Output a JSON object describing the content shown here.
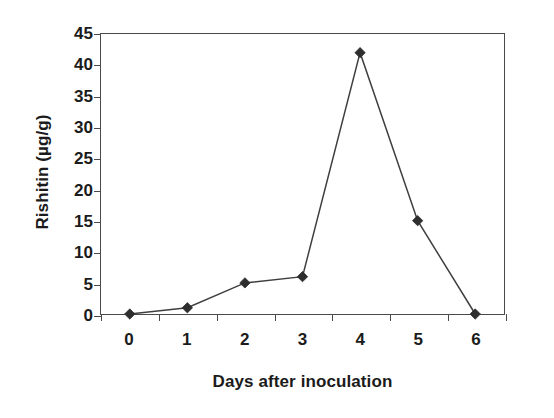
{
  "chart_data": {
    "type": "line",
    "title": "",
    "xlabel": "Days after inoculation",
    "ylabel": "Rishitin (µg/g)",
    "categories": [
      "0",
      "1",
      "2",
      "3",
      "4",
      "5",
      "6"
    ],
    "x": [
      0,
      1,
      2,
      3,
      4,
      5,
      6
    ],
    "values": [
      0,
      1,
      5,
      6,
      42,
      15,
      0
    ],
    "series": [
      {
        "name": "Rishitin",
        "values": [
          0,
          1,
          5,
          6,
          42,
          15,
          0
        ],
        "marker": "diamond",
        "color": "#3f3f3f"
      }
    ],
    "ylim": [
      0,
      45
    ],
    "yticks": [
      0,
      5,
      10,
      15,
      20,
      25,
      30,
      35,
      40,
      45
    ],
    "ytick_labels": [
      "0",
      "5",
      "10",
      "15",
      "20",
      "25",
      "30",
      "35",
      "40",
      "45"
    ],
    "xtick_labels": [
      "0",
      "1",
      "2",
      "3",
      "4",
      "5",
      "6"
    ],
    "grid": false,
    "legend": false,
    "legend_position": "none",
    "frame": "full-box",
    "tick_direction": "out",
    "background_color": "#ffffff",
    "line_color": "#3f3f3f",
    "marker_color": "#2e2e2e",
    "axis_color": "#4a4a4a",
    "text_color": "#1b1b1b"
  }
}
